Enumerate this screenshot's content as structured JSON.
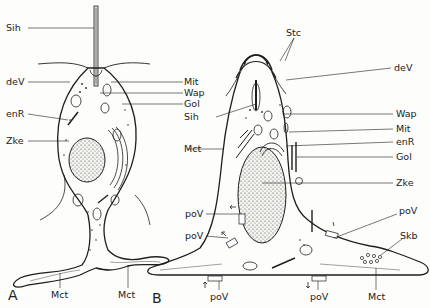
{
  "figure": {
    "panels": [
      {
        "id": "A",
        "label": "A"
      },
      {
        "id": "B",
        "label": "B"
      }
    ],
    "panel_a_labels": {
      "sih": "Sih",
      "dev": "deV",
      "enr": "enR",
      "zke": "Zke",
      "mit": "Mit",
      "wap": "Wap",
      "gol": "Gol",
      "mct_left": "Mct",
      "mct_right": "Mct"
    },
    "panel_b_labels": {
      "stc": "Stc",
      "dev": "deV",
      "sih": "Sih",
      "mct": "Mct",
      "wap": "Wap",
      "mit": "Mit",
      "enr": "enR",
      "gol": "Gol",
      "zke": "Zke",
      "pov_left_upper": "poV",
      "pov_left_lower": "poV",
      "pov_right": "poV",
      "skb": "Skb",
      "pov_bottom_left": "poV",
      "pov_bottom_right": "poV",
      "mct_bottom": "Mct"
    },
    "colors": {
      "ink": "#1e1e1e",
      "background": "#fdfdfb"
    }
  }
}
